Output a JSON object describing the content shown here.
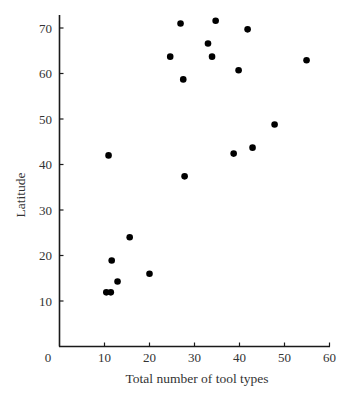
{
  "chart_data": {
    "type": "scatter",
    "title": "",
    "xlabel": "Total number of tool types",
    "ylabel": "Latitude",
    "xlim": [
      0,
      60
    ],
    "ylim": [
      0,
      73
    ],
    "x_ticks": [
      10,
      20,
      30,
      40,
      50,
      60
    ],
    "y_ticks": [
      10,
      20,
      30,
      40,
      50,
      60,
      70
    ],
    "origin_label": "0",
    "grid": false,
    "legend": null,
    "marker_color": "#000000",
    "series": [
      {
        "name": "Hunter-gatherer groups",
        "points": [
          {
            "x": 10.9,
            "y": 42
          },
          {
            "x": 24.6,
            "y": 63.7
          },
          {
            "x": 26.9,
            "y": 71
          },
          {
            "x": 34.7,
            "y": 71.6
          },
          {
            "x": 33.0,
            "y": 66.6
          },
          {
            "x": 33.9,
            "y": 63.7
          },
          {
            "x": 27.5,
            "y": 58.7
          },
          {
            "x": 39.8,
            "y": 60.7
          },
          {
            "x": 41.8,
            "y": 69.7
          },
          {
            "x": 54.9,
            "y": 62.9
          },
          {
            "x": 47.8,
            "y": 48.8
          },
          {
            "x": 42.9,
            "y": 43.7
          },
          {
            "x": 38.7,
            "y": 42.4
          },
          {
            "x": 27.8,
            "y": 37.4
          },
          {
            "x": 15.6,
            "y": 24.0
          },
          {
            "x": 11.6,
            "y": 18.9
          },
          {
            "x": 12.9,
            "y": 14.3
          },
          {
            "x": 20.0,
            "y": 16.0
          },
          {
            "x": 10.4,
            "y": 11.9
          },
          {
            "x": 11.4,
            "y": 11.9
          }
        ]
      }
    ]
  }
}
